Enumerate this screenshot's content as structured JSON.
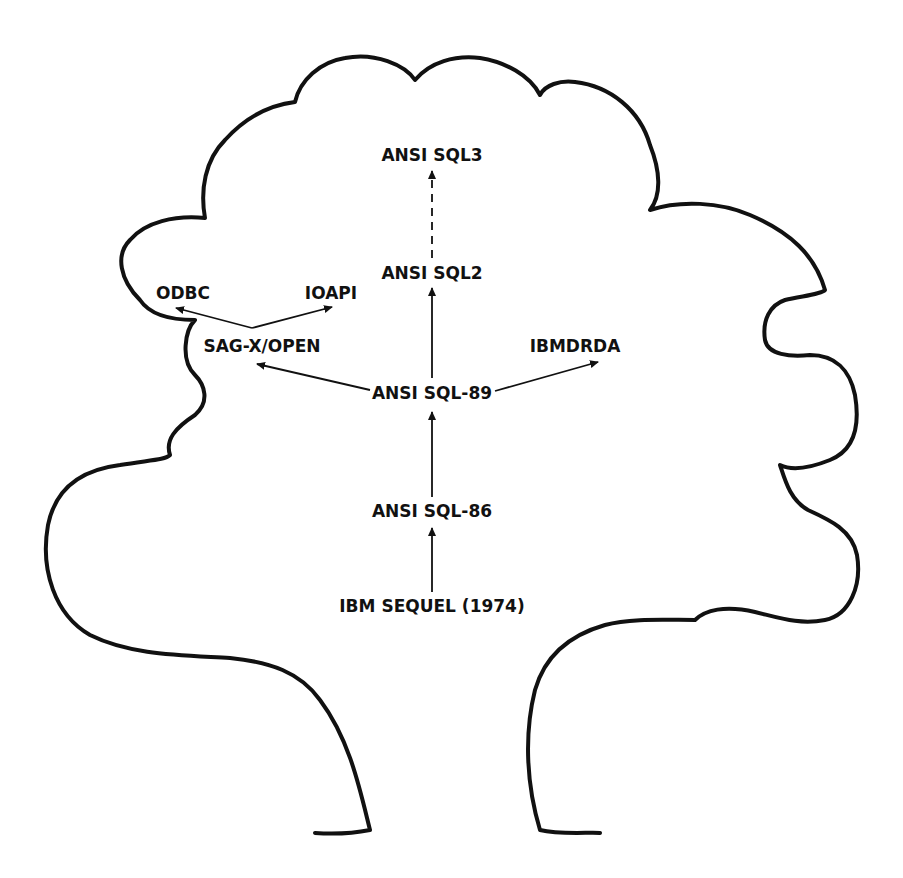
{
  "diagram": {
    "colors": {
      "ink": "#111111",
      "background": "#ffffff"
    },
    "nodes": [
      {
        "id": "sql3",
        "label": "ANSI SQL3",
        "x": 432,
        "y": 155
      },
      {
        "id": "sql2",
        "label": "ANSI SQL2",
        "x": 432,
        "y": 273
      },
      {
        "id": "odbc",
        "label": "ODBC",
        "x": 183,
        "y": 293
      },
      {
        "id": "ioapi",
        "label": "IOAPI",
        "x": 331,
        "y": 293
      },
      {
        "id": "sagx",
        "label": "SAG-X/OPEN",
        "x": 262,
        "y": 346
      },
      {
        "id": "ibmdrda",
        "label": "IBMDRDA",
        "x": 575,
        "y": 346
      },
      {
        "id": "sql89",
        "label": "ANSI SQL-89",
        "x": 432,
        "y": 393
      },
      {
        "id": "sql86",
        "label": "ANSI SQL-86",
        "x": 432,
        "y": 511
      },
      {
        "id": "sequel",
        "label": "IBM SEQUEL (1974)",
        "x": 432,
        "y": 606
      }
    ],
    "edges": [
      {
        "from": "sequel",
        "to": "sql86",
        "style": "solid"
      },
      {
        "from": "sql86",
        "to": "sql89",
        "style": "solid"
      },
      {
        "from": "sql89",
        "to": "sql2",
        "style": "solid"
      },
      {
        "from": "sql2",
        "to": "sql3",
        "style": "dashed"
      },
      {
        "from": "sql89",
        "to": "sagx",
        "style": "solid"
      },
      {
        "from": "sql89",
        "to": "ibmdrda",
        "style": "solid"
      },
      {
        "from": "sagx",
        "to": "odbc",
        "style": "solid"
      },
      {
        "from": "sagx",
        "to": "ioapi",
        "style": "solid"
      }
    ]
  }
}
